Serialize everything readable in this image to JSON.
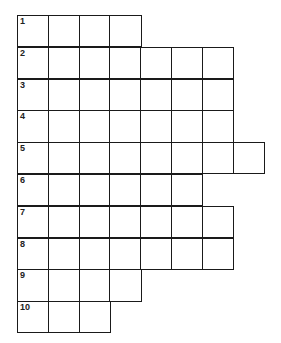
{
  "puzzle": {
    "type": "crossword-ladder",
    "cell_size_px": 31.8,
    "rows": [
      {
        "number": "1",
        "length": 4
      },
      {
        "number": "2",
        "length": 7
      },
      {
        "number": "3",
        "length": 7
      },
      {
        "number": "4",
        "length": 7
      },
      {
        "number": "5",
        "length": 8
      },
      {
        "number": "6",
        "length": 6
      },
      {
        "number": "7",
        "length": 7
      },
      {
        "number": "8",
        "length": 7
      },
      {
        "number": "9",
        "length": 4
      },
      {
        "number": "10",
        "length": 3
      }
    ]
  },
  "colors": {
    "line": "#1a1a1a",
    "background": "#ffffff"
  }
}
